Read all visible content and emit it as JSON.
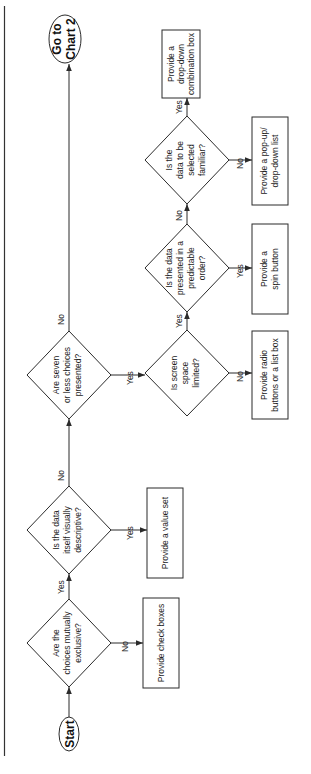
{
  "diagram": {
    "type": "flowchart",
    "orientation": "rotated-90-ccw",
    "colors": {
      "line": "#2b2b2b",
      "text": "#222222",
      "background": "#ffffff"
    },
    "terminals": {
      "start": {
        "line1": "Start"
      },
      "end": {
        "line1": "Go to",
        "line2": "Chart 2"
      }
    },
    "decisions": [
      {
        "id": "d1",
        "lines": [
          "Are the",
          "choices mutually",
          "exclusive?"
        ]
      },
      {
        "id": "d2",
        "lines": [
          "Is the data",
          "itself visually",
          "descriptive?"
        ]
      },
      {
        "id": "d3",
        "lines": [
          "Are seven",
          "or less choices",
          "presented?"
        ]
      },
      {
        "id": "d4",
        "lines": [
          "Is screen",
          "space",
          "limited?"
        ]
      },
      {
        "id": "d5",
        "lines": [
          "Is the data",
          "presented in a",
          "predictable",
          "order?"
        ]
      },
      {
        "id": "d6",
        "lines": [
          "Is the",
          "data to be",
          "selected",
          "familiar?"
        ]
      }
    ],
    "actions": [
      {
        "id": "a1",
        "lines": [
          "Provide check boxes"
        ]
      },
      {
        "id": "a2",
        "lines": [
          "Provide a value set"
        ]
      },
      {
        "id": "a3",
        "lines": [
          "Provide radio",
          "buttons or a list box"
        ]
      },
      {
        "id": "a4",
        "lines": [
          "Provide a",
          "spin button"
        ]
      },
      {
        "id": "a5",
        "lines": [
          "Provide a pop-up/",
          "drop-down list"
        ]
      },
      {
        "id": "a6",
        "lines": [
          "Provide a",
          "drop-down",
          "combination box"
        ]
      }
    ],
    "edge_labels": {
      "d1_yes": "Yes",
      "d1_no": "No",
      "d2_yes": "Yes",
      "d2_no": "No",
      "d3_yes": "Yes",
      "d3_no": "No",
      "d4_yes": "Yes",
      "d4_no": "No",
      "d5_yes": "Yes",
      "d5_no": "No",
      "d6_yes": "Yes",
      "d6_no": "No"
    },
    "edges": [
      {
        "from": "start",
        "to": "d1"
      },
      {
        "from": "d1",
        "to": "a1",
        "label": "No"
      },
      {
        "from": "d1",
        "to": "d2",
        "label": "Yes"
      },
      {
        "from": "d2",
        "to": "a2",
        "label": "Yes"
      },
      {
        "from": "d2",
        "to": "d3",
        "label": "No"
      },
      {
        "from": "d3",
        "to": "end",
        "label": "No"
      },
      {
        "from": "d3",
        "to": "d4",
        "label": "Yes"
      },
      {
        "from": "d4",
        "to": "a3",
        "label": "No"
      },
      {
        "from": "d4",
        "to": "d5",
        "label": "Yes"
      },
      {
        "from": "d5",
        "to": "a4",
        "label": "Yes"
      },
      {
        "from": "d5",
        "to": "d6",
        "label": "No"
      },
      {
        "from": "d6",
        "to": "a5",
        "label": "No"
      },
      {
        "from": "d6",
        "to": "a6",
        "label": "Yes"
      }
    ]
  }
}
